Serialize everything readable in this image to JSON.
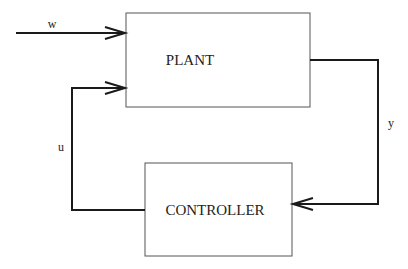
{
  "diagram": {
    "type": "feedback-control-block-diagram",
    "blocks": [
      {
        "id": "plant",
        "label": "PLANT"
      },
      {
        "id": "controller",
        "label": "CONTROLLER"
      }
    ],
    "signals": [
      {
        "id": "w",
        "label": "w",
        "from": "external",
        "to": "plant"
      },
      {
        "id": "u",
        "label": "u",
        "from": "controller",
        "to": "plant"
      },
      {
        "id": "y",
        "label": "y",
        "from": "plant",
        "to": "controller"
      }
    ],
    "colors": {
      "line": "#1a1a1a",
      "box": "#555555",
      "background": "#ffffff"
    }
  }
}
